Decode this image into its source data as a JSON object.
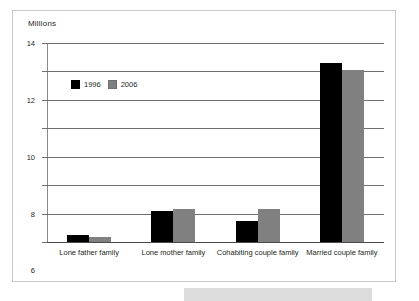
{
  "chart_data": {
    "type": "bar",
    "title": "",
    "subtitle": "",
    "xlabel": "",
    "ylabel": "Millions",
    "ylim": [
      0,
      14
    ],
    "ytick_step": 2,
    "yticks": [
      "0",
      "2",
      "4",
      "6",
      "8",
      "10",
      "12",
      "14"
    ],
    "grid": true,
    "legend_position": "inside-upper-left",
    "categories": [
      "Lone father family",
      "Lone mother family",
      "Cohabiting couple family",
      "Married couple family"
    ],
    "series": [
      {
        "name": "1996",
        "color": "#000000",
        "values": [
          0.5,
          2.15,
          1.45,
          12.6
        ]
      },
      {
        "name": "2006",
        "color": "#808080",
        "values": [
          0.35,
          2.35,
          2.3,
          12.1
        ]
      }
    ]
  },
  "legend": {
    "items": [
      {
        "label": "1996"
      },
      {
        "label": "2006"
      }
    ]
  },
  "axis": {
    "y_title": "Millions"
  }
}
